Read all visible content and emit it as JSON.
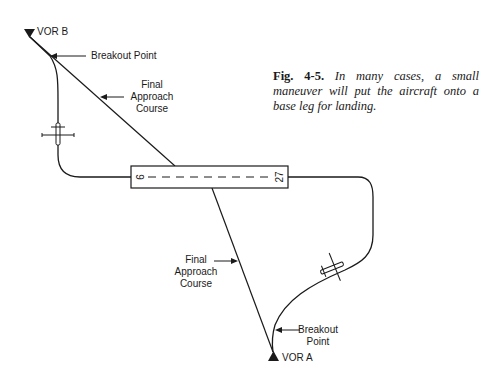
{
  "figure": {
    "number": "Fig. 4-5.",
    "caption": "In many cases, a small maneuver will put the aircraft onto a base leg for landing."
  },
  "labels": {
    "vor_b": "VOR B",
    "vor_a": "VOR A",
    "breakout_top": "Breakout Point",
    "breakout_bottom_1": "Breakout",
    "breakout_bottom_2": "Point",
    "fac_top_1": "Final",
    "fac_top_2": "Approach",
    "fac_top_3": "Course",
    "fac_bottom_1": "Final",
    "fac_bottom_2": "Approach",
    "fac_bottom_3": "Course"
  },
  "runway": {
    "left_number": "9",
    "right_number": "27"
  },
  "colors": {
    "ink": "#1a1a1a",
    "background": "#ffffff"
  }
}
